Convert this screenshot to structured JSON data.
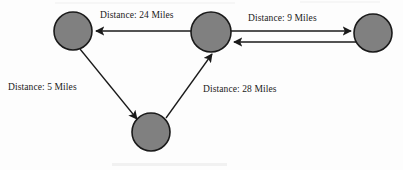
{
  "diagram": {
    "type": "directed-graph",
    "background_color": "#fdfdfd",
    "node_fill_color": "#808080",
    "node_stroke_color": "#1a1a1a",
    "edge_color": "#1a1a1a",
    "label_color": "#1a1a1a",
    "nodes": [
      {
        "id": "left",
        "name": "left-node",
        "cx": 73,
        "cy": 31,
        "r": 19
      },
      {
        "id": "center",
        "name": "center-node",
        "cx": 211,
        "cy": 32,
        "r": 20
      },
      {
        "id": "right",
        "name": "right-node",
        "cx": 373,
        "cy": 33,
        "r": 19
      },
      {
        "id": "bottom",
        "name": "bottom-node",
        "cx": 151,
        "cy": 132,
        "r": 19
      }
    ],
    "edges": [
      {
        "id": "center-to-left",
        "from": "center",
        "to": "left",
        "direction": "one-way",
        "label": "Distance: 24 Miles",
        "distance": 24,
        "unit": "Miles"
      },
      {
        "id": "center-right-pair",
        "from": "center",
        "to": "right",
        "direction": "two-way",
        "label": "Distance: 9 Miles",
        "distance": 9,
        "unit": "Miles"
      },
      {
        "id": "left-to-bottom",
        "from": "left",
        "to": "bottom",
        "direction": "one-way",
        "label": "Distance: 5 Miles",
        "distance": 5,
        "unit": "Miles"
      },
      {
        "id": "bottom-to-center",
        "from": "bottom",
        "to": "center",
        "direction": "one-way",
        "label": "Distance: 28 Miles",
        "distance": 28,
        "unit": "Miles"
      }
    ]
  }
}
